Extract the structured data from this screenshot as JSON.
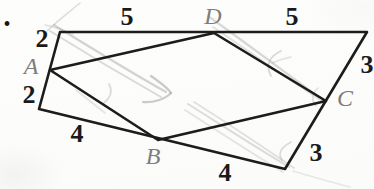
{
  "bullet": {
    "glyph": "•"
  },
  "figure": {
    "outer_quadrilateral": {
      "points": [
        [
          60,
          32
        ],
        [
          367,
          32
        ],
        [
          285,
          169
        ],
        [
          39,
          109
        ]
      ]
    },
    "inner_parallelogram": {
      "points": [
        [
          50,
          70
        ],
        [
          214,
          33
        ],
        [
          326,
          101
        ],
        [
          158,
          140
        ]
      ]
    },
    "stroke_width": 2.6,
    "vertex_labels": [
      {
        "text": "A",
        "x": 31,
        "y": 66
      },
      {
        "text": "B",
        "x": 153,
        "y": 156
      },
      {
        "text": "C",
        "x": 345,
        "y": 98
      },
      {
        "text": "D",
        "x": 213,
        "y": 16
      }
    ],
    "side_labels": [
      {
        "text": "5",
        "x": 127,
        "y": 17
      },
      {
        "text": "5",
        "x": 292,
        "y": 17
      },
      {
        "text": "2",
        "x": 42,
        "y": 39
      },
      {
        "text": "2",
        "x": 29,
        "y": 95
      },
      {
        "text": "3",
        "x": 367,
        "y": 65
      },
      {
        "text": "3",
        "x": 316,
        "y": 153
      },
      {
        "text": "4",
        "x": 77,
        "y": 134
      },
      {
        "text": "4",
        "x": 225,
        "y": 173
      }
    ],
    "pencil_strokes": [
      {
        "d": "M54,25 C85,44 125,69 166,92",
        "o": 0.45,
        "w": 2.2
      },
      {
        "d": "M50,31 C82,51 122,75 161,97",
        "o": 0.38,
        "w": 2.0
      },
      {
        "d": "M151,76 C161,83 168,88 171,93",
        "o": 0.55,
        "w": 2.2
      },
      {
        "d": "M171,93 C164,100 152,103 143,102",
        "o": 0.55,
        "w": 2.2
      },
      {
        "d": "M80,3 C68,13 56,22 47,31",
        "o": 0.35,
        "w": 1.6
      },
      {
        "d": "M45,25 C54,27 63,30 73,34",
        "o": 0.3,
        "w": 1.6
      },
      {
        "d": "M208,16 C243,41 282,70 319,97",
        "o": 0.4,
        "w": 2.2
      },
      {
        "d": "M213,27 C247,50 285,77 322,101",
        "o": 0.3,
        "w": 1.8
      },
      {
        "d": "M281,51 C270,56 265,65 271,76",
        "o": 0.4,
        "w": 1.8
      },
      {
        "d": "M272,63 C279,60 285,58 291,57",
        "o": 0.3,
        "w": 1.5
      },
      {
        "d": "M318,88 C312,94 311,100 316,106",
        "o": 0.3,
        "w": 1.6
      },
      {
        "d": "M188,104 C223,126 257,148 289,167",
        "o": 0.35,
        "w": 2.0
      },
      {
        "d": "M194,102 C229,124 263,147 294,168",
        "o": 0.3,
        "w": 1.8
      },
      {
        "d": "M185,110 C219,132 253,154 283,172",
        "o": 0.28,
        "w": 1.8
      },
      {
        "d": "M291,142 C282,147 277,153 282,160",
        "o": 0.35,
        "w": 1.8
      },
      {
        "d": "M293,171 C312,177 331,182 350,187",
        "o": 0.22,
        "w": 1.8
      },
      {
        "d": "M109,84 C113,91 111,97 104,103",
        "o": 0.35,
        "w": 1.8
      },
      {
        "d": "M76,90 C86,98 96,106 105,113",
        "o": 0.25,
        "w": 1.8
      }
    ],
    "colors": {
      "line": "#1c1c1c",
      "vertex_label": "#7d7d7d",
      "side_label": "#1a1a1a",
      "pencil": "#a0a0a0",
      "paper": "#fcfcfb"
    }
  }
}
